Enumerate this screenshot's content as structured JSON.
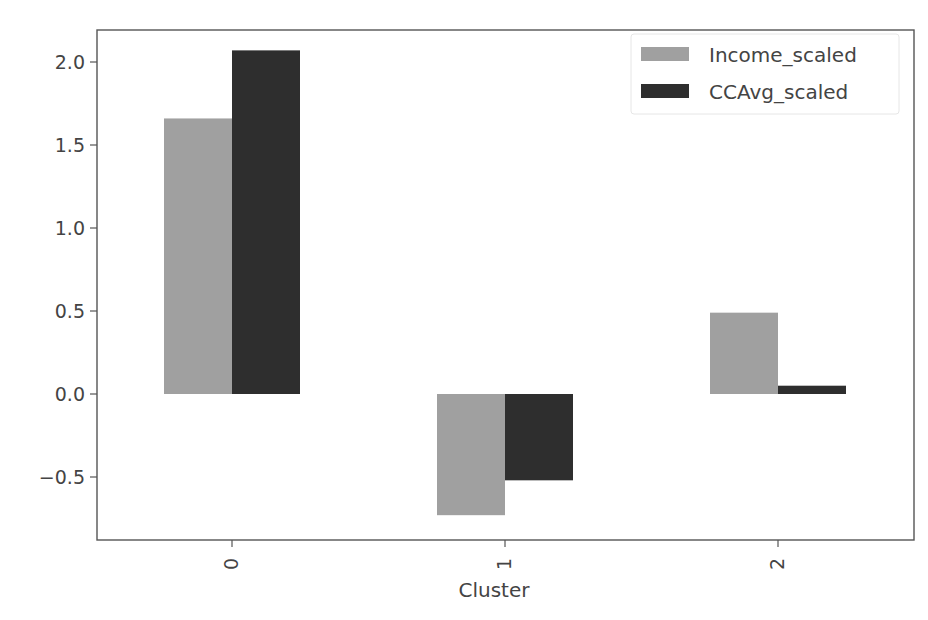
{
  "chart_data": {
    "type": "bar",
    "title": "",
    "xlabel": "Cluster",
    "ylabel": "",
    "categories": [
      "0",
      "1",
      "2"
    ],
    "series": [
      {
        "name": "Income_scaled",
        "color": "#a0a0a0",
        "values": [
          1.66,
          -0.73,
          0.49
        ]
      },
      {
        "name": "CCAvg_scaled",
        "color": "#2e2e2e",
        "values": [
          2.07,
          -0.52,
          0.05
        ]
      }
    ],
    "ylim": [
      -0.85,
      2.2
    ],
    "yticks": [
      "2.0",
      "1.5",
      "1.0",
      "0.5",
      "0.0",
      "−0.5"
    ],
    "ytick_values": [
      2.0,
      1.5,
      1.0,
      0.5,
      0.0,
      -0.5
    ],
    "xtick_rotation": 90,
    "grid": false,
    "legend_position": "upper right"
  }
}
